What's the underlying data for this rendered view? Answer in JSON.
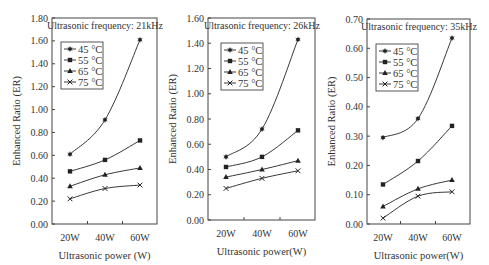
{
  "chart_data": [
    {
      "type": "line",
      "title": "Ultrasonic frequency: 21kHz",
      "xlabel": "Ultrasonic power (W)",
      "ylabel": "Enhanced Ratio (ER)",
      "categories": [
        "20W",
        "40W",
        "60W"
      ],
      "ylim": [
        0,
        1.8
      ],
      "yticks": [
        "0.00",
        "0.20",
        "0.40",
        "0.60",
        "0.80",
        "1.00",
        "1.20",
        "1.40",
        "1.60",
        "1.80"
      ],
      "grid": false,
      "legend_position": "upper-left",
      "series": [
        {
          "name": "45 °C",
          "marker": "star",
          "values": [
            0.61,
            0.91,
            1.61
          ]
        },
        {
          "name": "55 °C",
          "marker": "square",
          "values": [
            0.46,
            0.56,
            0.73
          ]
        },
        {
          "name": "65 °C",
          "marker": "triangle",
          "values": [
            0.33,
            0.43,
            0.49
          ]
        },
        {
          "name": "75 °C",
          "marker": "x",
          "values": [
            0.22,
            0.31,
            0.34
          ]
        }
      ]
    },
    {
      "type": "line",
      "title": "Ultrasonic frequency: 26kHz",
      "xlabel": "Ultrasonic power(W)",
      "ylabel": "Enhanced Ratio (ER)",
      "categories": [
        "20W",
        "40W",
        "60W"
      ],
      "ylim": [
        0,
        1.6
      ],
      "yticks": [
        "0.00",
        "0.20",
        "0.40",
        "0.60",
        "0.80",
        "1.00",
        "1.20",
        "1.40",
        "1.60"
      ],
      "grid": false,
      "legend_position": "upper-left",
      "series": [
        {
          "name": "45 °C",
          "marker": "star",
          "values": [
            0.5,
            0.72,
            1.43
          ]
        },
        {
          "name": "55 °C",
          "marker": "square",
          "values": [
            0.42,
            0.5,
            0.71
          ]
        },
        {
          "name": "65 °C",
          "marker": "triangle",
          "values": [
            0.34,
            0.4,
            0.47
          ]
        },
        {
          "name": "75 °C",
          "marker": "x",
          "values": [
            0.25,
            0.33,
            0.39
          ]
        }
      ]
    },
    {
      "type": "line",
      "title": "Ultrasonic frequency: 35kHz",
      "xlabel": "Ultrasonic power(W)",
      "ylabel": "Enhanced Ratio (ER)",
      "categories": [
        "20W",
        "40W",
        "60W"
      ],
      "ylim": [
        0,
        0.7
      ],
      "yticks": [
        "0.00",
        "0.10",
        "0.20",
        "0.30",
        "0.40",
        "0.50",
        "0.60",
        "0.70"
      ],
      "grid": false,
      "legend_position": "upper-left",
      "series": [
        {
          "name": "45 °C",
          "marker": "star",
          "values": [
            0.295,
            0.36,
            0.635
          ]
        },
        {
          "name": "55 °C",
          "marker": "square",
          "values": [
            0.135,
            0.215,
            0.335
          ]
        },
        {
          "name": "65 °C",
          "marker": "triangle",
          "values": [
            0.06,
            0.12,
            0.15
          ]
        },
        {
          "name": "75 °C",
          "marker": "x",
          "values": [
            0.02,
            0.095,
            0.11
          ]
        }
      ]
    }
  ],
  "layout": {
    "panels": [
      {
        "left": 52,
        "right": 157,
        "top": 18,
        "bottom": 224,
        "xs": [
          70,
          105,
          140
        ],
        "legend": {
          "x": 61,
          "y": 42,
          "w": 42,
          "h": 47
        },
        "title_x": 105
      },
      {
        "left": 208,
        "right": 315,
        "top": 18,
        "bottom": 220,
        "xs": [
          226,
          262,
          298
        ],
        "legend": {
          "x": 221,
          "y": 43,
          "w": 42,
          "h": 47
        },
        "title_x": 262
      },
      {
        "left": 367,
        "right": 470,
        "top": 19,
        "bottom": 224,
        "xs": [
          383,
          418,
          452
        ],
        "legend": {
          "x": 376,
          "y": 44,
          "w": 42,
          "h": 47
        },
        "title_x": 419
      }
    ],
    "colors": {
      "line": "#222222",
      "axis": "#444444",
      "text": "#333333"
    }
  }
}
